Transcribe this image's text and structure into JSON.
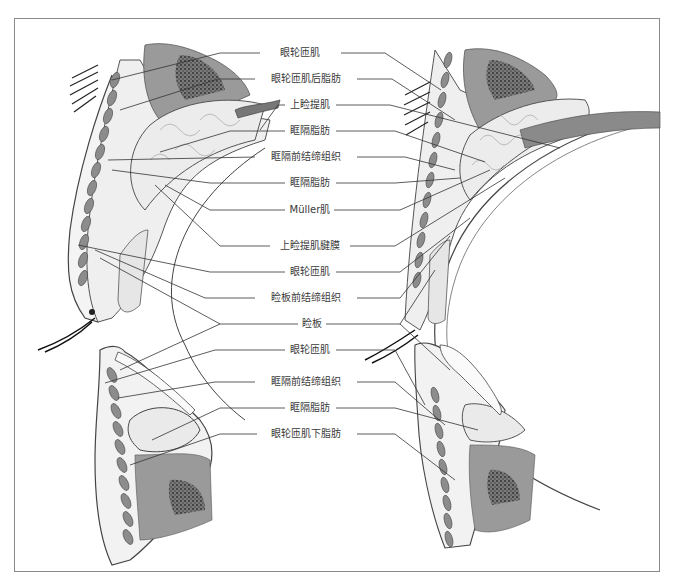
{
  "figure": {
    "type": "anatomical-diagram",
    "panels": [
      "left cross-section",
      "right cross-section"
    ]
  },
  "labels": [
    {
      "id": "orbicularis-1",
      "text": "眼轮匝肌",
      "y": 53
    },
    {
      "id": "roof",
      "text": "眼轮匝肌后脂肪",
      "y": 79
    },
    {
      "id": "levator",
      "text": "上睑提肌",
      "y": 105
    },
    {
      "id": "orbital-fat-1",
      "text": "眶隔脂肪",
      "y": 131
    },
    {
      "id": "preseptal-ct-1",
      "text": "眶隔前结缔组织",
      "y": 157
    },
    {
      "id": "orbital-fat-2",
      "text": "眶隔脂肪",
      "y": 183
    },
    {
      "id": "muller",
      "text": "Müller肌",
      "y": 210
    },
    {
      "id": "levator-aponeurosis",
      "text": "上睑提肌腱膜",
      "y": 246
    },
    {
      "id": "orbicularis-2",
      "text": "眼轮匝肌",
      "y": 272
    },
    {
      "id": "pretarsal-ct",
      "text": "睑板前结缔组织",
      "y": 298
    },
    {
      "id": "tarsus",
      "text": "睑板",
      "y": 324
    },
    {
      "id": "orbicularis-3",
      "text": "眼轮匝肌",
      "y": 350
    },
    {
      "id": "preseptal-ct-2",
      "text": "眶隔前结缔组织",
      "y": 382
    },
    {
      "id": "orbital-fat-3",
      "text": "眶隔脂肪",
      "y": 408
    },
    {
      "id": "soof",
      "text": "眼轮匝肌下脂肪",
      "y": 434
    }
  ],
  "colors": {
    "frame": "#8a8a8a",
    "line": "#333333",
    "muscle": "#8c8c8c",
    "fat": "#ececec",
    "skin": "#f4f4f4",
    "text": "#3a3a3a"
  }
}
